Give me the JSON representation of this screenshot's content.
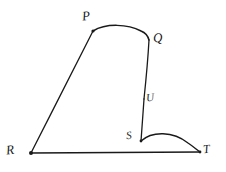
{
  "figure": {
    "kind": "hand-drawn-geometry-diagram",
    "background_color": "#ffffff",
    "ink_color": "#1a1a1a",
    "width": 226,
    "height": 172,
    "labels": {
      "p": "P",
      "q": "Q",
      "u": "U",
      "s": "S",
      "r": "R",
      "t": "T"
    },
    "points": {
      "P": {
        "x": 93,
        "y": 31
      },
      "Q": {
        "x": 149,
        "y": 40
      },
      "U": {
        "x": 144,
        "y": 99
      },
      "S": {
        "x": 141,
        "y": 141
      },
      "R": {
        "x": 31,
        "y": 153
      },
      "T": {
        "x": 200,
        "y": 152
      }
    },
    "paths": {
      "arc_P_Q": "M 93 31 C 106 23 128 24 141 31 C 146 33 148 36 149 40",
      "segment_Q_U": "M 149 40 C 148 58 146 80 144 99",
      "segment_U_S": "M 144 99 C 143 113 142 128 141 141",
      "segment_R_P": "M 31 153 C 52 112 76 64 93 31",
      "segment_R_T": "M 31 153 L 200 152",
      "arc_S_T": "M 141 141 C 152 131 173 131 188 143 C 194 147 197 150 200 152"
    },
    "stroke_widths": {
      "segment": 1.3,
      "arc": 1.5
    }
  }
}
